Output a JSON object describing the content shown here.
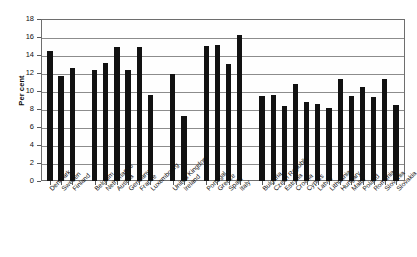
{
  "chart_data": {
    "type": "bar",
    "title": "",
    "xlabel": "",
    "ylabel": "Per cent",
    "ylim": [
      0,
      18
    ],
    "ytick_step": 2,
    "yticks": [
      0,
      2,
      4,
      6,
      8,
      10,
      12,
      14,
      16,
      18
    ],
    "grid": true,
    "legend": "none",
    "bar_color": "#111111",
    "categories": [
      "Denmark",
      "Sweden",
      "Finland",
      "Belgium",
      "Netherlands",
      "Austria",
      "Germany",
      "France",
      "Luxembourg",
      "United Kingdom",
      "Ireland",
      "Portugal",
      "Greece",
      "Spain",
      "Italy",
      "Bulgaria",
      "Czech Republic",
      "Estonia",
      "Croatia",
      "Cyprus",
      "Latvia",
      "Lithuania",
      "Hungary",
      "Malta",
      "Poland",
      "Romania",
      "Slovenia",
      "Slovakia"
    ],
    "values": [
      14.4,
      11.7,
      12.6,
      12.3,
      13.1,
      14.9,
      12.3,
      14.9,
      9.6,
      11.9,
      7.2,
      15.0,
      15.1,
      13.0,
      16.2,
      9.4,
      9.6,
      8.3,
      10.8,
      8.8,
      8.6,
      8.1,
      11.3,
      9.5,
      10.5,
      9.3,
      11.3,
      8.4
    ],
    "group_breaks": [
      3,
      9,
      11,
      15
    ]
  }
}
